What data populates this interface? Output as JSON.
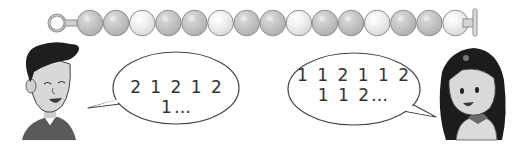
{
  "necklace": {
    "bead_count": 15,
    "pattern_description": "2 gray, 1 white repeating",
    "beads": [
      "gray",
      "gray",
      "white",
      "gray",
      "gray",
      "white",
      "gray",
      "gray",
      "white",
      "gray",
      "gray",
      "white",
      "gray",
      "gray",
      "white"
    ],
    "colors": {
      "gray": "#c4c4c4",
      "white": "#efefef",
      "outline": "#8f8f8f"
    }
  },
  "left_speech": {
    "speaker": "boy",
    "text": "2 1 2 1 2 1…"
  },
  "right_speech": {
    "speaker": "girl",
    "lines": [
      "1 1 2 1 1 2",
      "1 1 2…"
    ]
  }
}
